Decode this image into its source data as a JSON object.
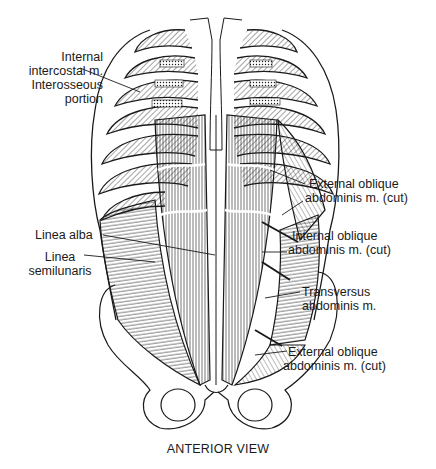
{
  "figure": {
    "caption": "ANTERIOR VIEW",
    "labels": {
      "internal_intercostal": [
        "Internal",
        "intercostal m.",
        "Interosseous",
        "portion"
      ],
      "linea_alba": [
        "Linea alba"
      ],
      "linea_semilunaris": [
        "Linea",
        "semilunaris"
      ],
      "external_oblique_top": [
        "External oblique",
        "abdominis m. (cut)"
      ],
      "internal_oblique": [
        "Internal oblique",
        "abdominis m. (cut)"
      ],
      "transversus": [
        "Transversus",
        "abdominis m."
      ],
      "external_oblique_bottom": [
        "External oblique",
        "abdominis m. (cut)"
      ]
    },
    "colors": {
      "ink": "#1a1a1a",
      "background": "#ffffff"
    }
  }
}
